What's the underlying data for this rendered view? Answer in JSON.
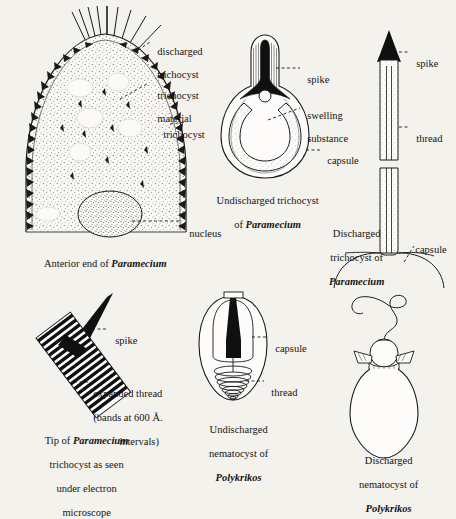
{
  "figure": {
    "title_domain": "biology-plate-trichocysts-nematocysts",
    "background_color": "#f4f2ed",
    "ink_color": "#141414"
  },
  "panels": [
    {
      "id": "anterior-end-paramecium",
      "caption_plain": "Anterior end of ",
      "caption_species": "Paramecium",
      "labels": [
        {
          "id": "discharged-trichocyst",
          "line1": "discharged",
          "line2": "trichocyst"
        },
        {
          "id": "trichocyst-material",
          "line1": "trichocyst",
          "line2": "material"
        },
        {
          "id": "trichocyst",
          "line1": "trichocyst",
          "line2": ""
        },
        {
          "id": "nucleus",
          "line1": "nucleus",
          "line2": ""
        }
      ]
    },
    {
      "id": "undischarged-trichocyst-paramecium",
      "caption_line1": "Undischarged trichocyst",
      "caption_line2_plain": "of ",
      "caption_species": "Paramecium",
      "labels": [
        {
          "id": "spike",
          "line1": "spike",
          "line2": ""
        },
        {
          "id": "swelling-substance",
          "line1": "swelling",
          "line2": "substance"
        },
        {
          "id": "capsule",
          "line1": "capsule",
          "line2": ""
        }
      ]
    },
    {
      "id": "discharged-trichocyst-paramecium",
      "caption_line1": "Discharged",
      "caption_line2": "trichocyst of",
      "caption_species": "Paramecium",
      "labels": [
        {
          "id": "spike",
          "line1": "spike",
          "line2": ""
        },
        {
          "id": "thread",
          "line1": "thread",
          "line2": ""
        },
        {
          "id": "capsule",
          "line1": "capsule",
          "line2": ""
        }
      ]
    },
    {
      "id": "tip-paramecium-trichocyst",
      "caption_line1_plain": "Tip of ",
      "caption_species": "Paramecium",
      "caption_line2": "trichocyst as seen",
      "caption_line3": "under electron",
      "caption_line4": "microscope",
      "labels": [
        {
          "id": "spike",
          "line1": "spike",
          "line2": ""
        },
        {
          "id": "expanded-thread",
          "line1": "expanded thread",
          "line2": "(bands at 600 Å.",
          "line3": "intervals)"
        }
      ]
    },
    {
      "id": "undischarged-nematocyst-polykrikos",
      "caption_line1": "Undischarged",
      "caption_line2": "nematocyst of",
      "caption_species": "Polykrikos",
      "labels": [
        {
          "id": "capsule",
          "line1": "capsule",
          "line2": ""
        },
        {
          "id": "thread",
          "line1": "thread",
          "line2": ""
        }
      ]
    },
    {
      "id": "discharged-nematocyst-polykrikos",
      "caption_line1": "Discharged",
      "caption_line2": "nematocyst of",
      "caption_species": "Polykrikos"
    }
  ]
}
